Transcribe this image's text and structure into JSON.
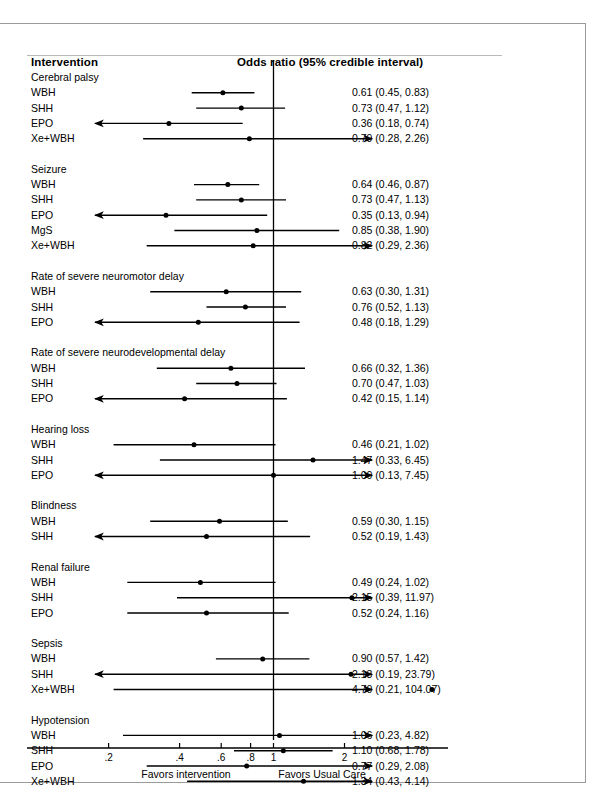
{
  "figure": {
    "header": {
      "left_title": "Intervention",
      "right_title": "Odds ratio (95% credible interval)"
    },
    "axis": {
      "tick_labels": [
        ".2",
        ".4",
        ".6",
        ".8",
        "1",
        "2"
      ],
      "caption_left": "Favors intervention",
      "caption_right": "Favors Usual Care"
    }
  },
  "chart_data": {
    "type": "forest",
    "title": "Odds ratio (95% credible interval)",
    "xlabel": "Odds ratio",
    "ylabel": "Intervention",
    "xscale": "log",
    "xlim": [
      0.17,
      2.55
    ],
    "xticks": [
      0.2,
      0.4,
      0.6,
      0.8,
      1,
      2
    ],
    "xtick_labels": [
      ".2",
      ".4",
      ".6",
      ".8",
      "1",
      "2"
    ],
    "reference_line": 1,
    "grid": false,
    "legend": "none",
    "annotations": [
      "Favors intervention",
      "Favors Usual Care"
    ],
    "groups": [
      {
        "name": "Cerebral palsy",
        "rows": [
          {
            "label": "WBH",
            "est": 0.61,
            "lo": 0.45,
            "hi": 0.83,
            "text": "0.61 (0.45, 0.83)",
            "clip_lo": false,
            "clip_hi": false
          },
          {
            "label": "SHH",
            "est": 0.73,
            "lo": 0.47,
            "hi": 1.12,
            "text": "0.73 (0.47, 1.12)",
            "clip_lo": false,
            "clip_hi": false
          },
          {
            "label": "EPO",
            "est": 0.36,
            "lo": 0.18,
            "hi": 0.74,
            "text": "0.36 (0.18, 0.74)",
            "clip_lo": true,
            "clip_hi": false
          },
          {
            "label": "Xe+WBH",
            "est": 0.79,
            "lo": 0.28,
            "hi": 2.26,
            "text": "0.79 (0.28, 2.26)",
            "clip_lo": false,
            "clip_hi": true
          }
        ]
      },
      {
        "name": "Seizure",
        "rows": [
          {
            "label": "WBH",
            "est": 0.64,
            "lo": 0.46,
            "hi": 0.87,
            "text": "0.64 (0.46, 0.87)",
            "clip_lo": false,
            "clip_hi": false
          },
          {
            "label": "SHH",
            "est": 0.73,
            "lo": 0.47,
            "hi": 1.13,
            "text": "0.73 (0.47, 1.13)",
            "clip_lo": false,
            "clip_hi": false
          },
          {
            "label": "EPO",
            "est": 0.35,
            "lo": 0.13,
            "hi": 0.94,
            "text": "0.35 (0.13, 0.94)",
            "clip_lo": true,
            "clip_hi": false
          },
          {
            "label": "MgS",
            "est": 0.85,
            "lo": 0.38,
            "hi": 1.9,
            "text": "0.85 (0.38, 1.90)",
            "clip_lo": false,
            "clip_hi": false
          },
          {
            "label": "Xe+WBH",
            "est": 0.82,
            "lo": 0.29,
            "hi": 2.36,
            "text": "0.82 (0.29, 2.36)",
            "clip_lo": false,
            "clip_hi": true
          }
        ]
      },
      {
        "name": "Rate of severe neuromotor delay",
        "rows": [
          {
            "label": "WBH",
            "est": 0.63,
            "lo": 0.3,
            "hi": 1.31,
            "text": "0.63 (0.30, 1.31)",
            "clip_lo": false,
            "clip_hi": false
          },
          {
            "label": "SHH",
            "est": 0.76,
            "lo": 0.52,
            "hi": 1.13,
            "text": "0.76 (0.52, 1.13)",
            "clip_lo": false,
            "clip_hi": false
          },
          {
            "label": "EPO",
            "est": 0.48,
            "lo": 0.18,
            "hi": 1.29,
            "text": "0.48 (0.18, 1.29)",
            "clip_lo": true,
            "clip_hi": false
          }
        ]
      },
      {
        "name": "Rate of severe neurodevelopmental delay",
        "rows": [
          {
            "label": "WBH",
            "est": 0.66,
            "lo": 0.32,
            "hi": 1.36,
            "text": "0.66 (0.32, 1.36)",
            "clip_lo": false,
            "clip_hi": false
          },
          {
            "label": "SHH",
            "est": 0.7,
            "lo": 0.47,
            "hi": 1.03,
            "text": "0.70 (0.47, 1.03)",
            "clip_lo": false,
            "clip_hi": false
          },
          {
            "label": "EPO",
            "est": 0.42,
            "lo": 0.15,
            "hi": 1.14,
            "text": "0.42 (0.15, 1.14)",
            "clip_lo": true,
            "clip_hi": false
          }
        ]
      },
      {
        "name": "Hearing loss",
        "rows": [
          {
            "label": "WBH",
            "est": 0.46,
            "lo": 0.21,
            "hi": 1.02,
            "text": "0.46 (0.21, 1.02)",
            "clip_lo": false,
            "clip_hi": false
          },
          {
            "label": "SHH",
            "est": 1.47,
            "lo": 0.33,
            "hi": 6.45,
            "text": "1.47 (0.33, 6.45)",
            "clip_lo": false,
            "clip_hi": true
          },
          {
            "label": "EPO",
            "est": 1.0,
            "lo": 0.13,
            "hi": 7.45,
            "text": "1.00 (0.13, 7.45)",
            "clip_lo": true,
            "clip_hi": true
          }
        ]
      },
      {
        "name": "Blindness",
        "rows": [
          {
            "label": "WBH",
            "est": 0.59,
            "lo": 0.3,
            "hi": 1.15,
            "text": "0.59 (0.30, 1.15)",
            "clip_lo": false,
            "clip_hi": false
          },
          {
            "label": "SHH",
            "est": 0.52,
            "lo": 0.19,
            "hi": 1.43,
            "text": "0.52 (0.19, 1.43)",
            "clip_lo": true,
            "clip_hi": false
          }
        ]
      },
      {
        "name": "Renal failure",
        "rows": [
          {
            "label": "WBH",
            "est": 0.49,
            "lo": 0.24,
            "hi": 1.02,
            "text": "0.49 (0.24, 1.02)",
            "clip_lo": false,
            "clip_hi": false
          },
          {
            "label": "SHH",
            "est": 2.15,
            "lo": 0.39,
            "hi": 11.97,
            "text": "2.15 (0.39, 11.97)",
            "clip_lo": false,
            "clip_hi": true
          },
          {
            "label": "EPO",
            "est": 0.52,
            "lo": 0.24,
            "hi": 1.16,
            "text": "0.52 (0.24, 1.16)",
            "clip_lo": false,
            "clip_hi": false
          }
        ]
      },
      {
        "name": "Sepsis",
        "rows": [
          {
            "label": "WBH",
            "est": 0.9,
            "lo": 0.57,
            "hi": 1.42,
            "text": "0.90 (0.57, 1.42)",
            "clip_lo": false,
            "clip_hi": false
          },
          {
            "label": "SHH",
            "est": 2.13,
            "lo": 0.19,
            "hi": 23.79,
            "text": "2.13 (0.19, 23.79)",
            "clip_lo": true,
            "clip_hi": true
          },
          {
            "label": "Xe+WBH",
            "est": 4.7,
            "lo": 0.21,
            "hi": 104.07,
            "text": "4.70 (0.21, 104.07)",
            "clip_lo": false,
            "clip_hi": true
          }
        ]
      },
      {
        "name": "Hypotension",
        "rows": [
          {
            "label": "WBH",
            "est": 1.06,
            "lo": 0.23,
            "hi": 4.82,
            "text": "1.06 (0.23, 4.82)",
            "clip_lo": false,
            "clip_hi": true
          },
          {
            "label": "SHH",
            "est": 1.1,
            "lo": 0.68,
            "hi": 1.78,
            "text": "1.10 (0.68, 1.78)",
            "clip_lo": false,
            "clip_hi": false
          },
          {
            "label": "EPO",
            "est": 0.77,
            "lo": 0.29,
            "hi": 2.08,
            "text": "0.77 (0.29, 2.08)",
            "clip_lo": false,
            "clip_hi": true
          },
          {
            "label": "Xe+WBH",
            "est": 1.34,
            "lo": 0.43,
            "hi": 4.14,
            "text": "1.34 (0.43, 4.14)",
            "clip_lo": false,
            "clip_hi": true
          }
        ]
      }
    ]
  }
}
